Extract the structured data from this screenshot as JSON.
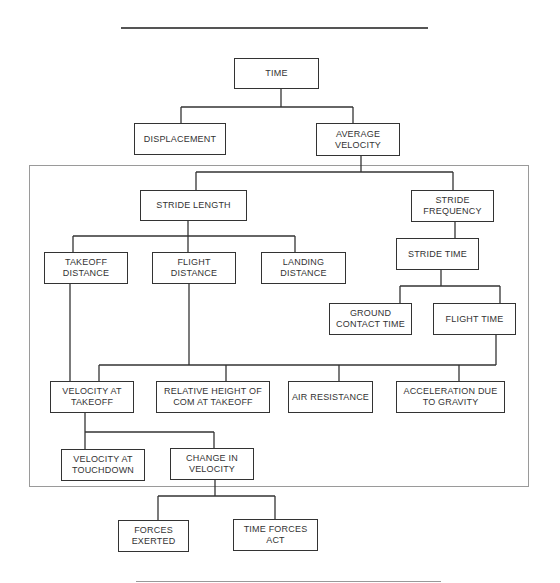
{
  "diagram": {
    "type": "hierarchy",
    "nodes": {
      "time": "TIME",
      "displacement": "DISPLACEMENT",
      "average_velocity": "AVERAGE VELOCITY",
      "stride_length": "STRIDE LENGTH",
      "stride_frequency": "STRIDE FREQUENCY",
      "stride_time": "STRIDE TIME",
      "takeoff_distance": "TAKEOFF DISTANCE",
      "flight_distance": "FLIGHT DISTANCE",
      "landing_distance": "LANDING DISTANCE",
      "ground_contact_time": "GROUND CONTACT TIME",
      "flight_time": "FLIGHT TIME",
      "velocity_at_takeoff": "VELOCITY AT TAKEOFF",
      "relative_height_com": "RELATIVE HEIGHT OF COM AT TAKEOFF",
      "air_resistance": "AIR RESISTANCE",
      "acceleration_gravity": "ACCELERATION DUE TO GRAVITY",
      "velocity_at_touchdown": "VELOCITY AT TOUCHDOWN",
      "change_in_velocity": "CHANGE IN VELOCITY",
      "forces_exerted": "FORCES EXERTED",
      "time_forces_act": "TIME FORCES ACT"
    },
    "edges": [
      [
        "time",
        "displacement"
      ],
      [
        "time",
        "average_velocity"
      ],
      [
        "average_velocity",
        "stride_length"
      ],
      [
        "average_velocity",
        "stride_frequency"
      ],
      [
        "stride_length",
        "takeoff_distance"
      ],
      [
        "stride_length",
        "flight_distance"
      ],
      [
        "stride_length",
        "landing_distance"
      ],
      [
        "stride_frequency",
        "stride_time"
      ],
      [
        "stride_time",
        "ground_contact_time"
      ],
      [
        "stride_time",
        "flight_time"
      ],
      [
        "flight_distance",
        "velocity_at_takeoff"
      ],
      [
        "flight_distance",
        "relative_height_com"
      ],
      [
        "flight_distance",
        "air_resistance"
      ],
      [
        "flight_distance",
        "acceleration_gravity"
      ],
      [
        "flight_time",
        "velocity_at_takeoff"
      ],
      [
        "flight_time",
        "acceleration_gravity"
      ],
      [
        "takeoff_distance",
        "velocity_at_takeoff"
      ],
      [
        "velocity_at_takeoff",
        "velocity_at_touchdown"
      ],
      [
        "velocity_at_takeoff",
        "change_in_velocity"
      ],
      [
        "change_in_velocity",
        "forces_exerted"
      ],
      [
        "change_in_velocity",
        "time_forces_act"
      ]
    ]
  }
}
